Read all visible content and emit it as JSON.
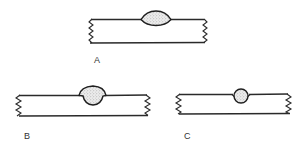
{
  "figure": {
    "type": "weld cross-section diagram",
    "panels": [
      {
        "id": "A",
        "label": "A",
        "description": "butt weld with lens-shaped bead protruding above and slightly below the top surface",
        "plate": {
          "x1": 89,
          "x2": 205,
          "top_y": 19,
          "bottom_y": 43
        },
        "weld": {
          "shape": "lens",
          "cx": 156,
          "x1": 141,
          "x2": 171,
          "top_y": 11,
          "bottom_y": 25
        },
        "label_pos": {
          "x": 94,
          "y": 57
        }
      },
      {
        "id": "B",
        "label": "B",
        "description": "weld with wide rounded cap above the surface and root penetrating below the top line",
        "plate": {
          "x1": 17,
          "x2": 148,
          "top_y": 95,
          "bottom_y": 116
        },
        "weld": {
          "shape": "cap",
          "cx": 93,
          "x1": 79,
          "x2": 106,
          "top_y": 86,
          "bottom_y": 105
        },
        "label_pos": {
          "x": 24,
          "y": 133
        }
      },
      {
        "id": "C",
        "label": "C",
        "description": "small circular weld nugget seated in the top surface",
        "plate": {
          "x1": 177,
          "x2": 290,
          "top_y": 94,
          "bottom_y": 114
        },
        "weld": {
          "shape": "circle",
          "cx": 241,
          "cy": 96,
          "r": 7
        },
        "label_pos": {
          "x": 184,
          "y": 133
        }
      }
    ],
    "colors": {
      "line": "#2a2a2a",
      "weld_fill": "#e6e6e6",
      "stipple": "#8a8a8a",
      "background": "#ffffff",
      "label": "#333333"
    }
  }
}
